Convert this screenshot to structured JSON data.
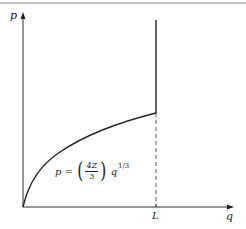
{
  "diagram": {
    "type": "p-q plot with piecewise curve",
    "axes": {
      "y_label": "p",
      "x_label": "q",
      "x_marker": "L"
    },
    "curve": {
      "formula_lhs": "p",
      "formula_eq": "=",
      "formula_open_paren": "(",
      "formula_numerator": "4Z",
      "formula_denominator": "3",
      "formula_close_paren": ")",
      "formula_var": "q",
      "formula_exponent": "1/3",
      "description": "Concave curve from origin rising to q = L, then a vertical line upward at q = L"
    },
    "dashed_line": "Vertical dashed line from the q-axis at L up to the curve",
    "colors": {
      "axis": "#333333",
      "curve": "#222222",
      "top_rule": "#888888",
      "background": "#ffffff"
    }
  }
}
